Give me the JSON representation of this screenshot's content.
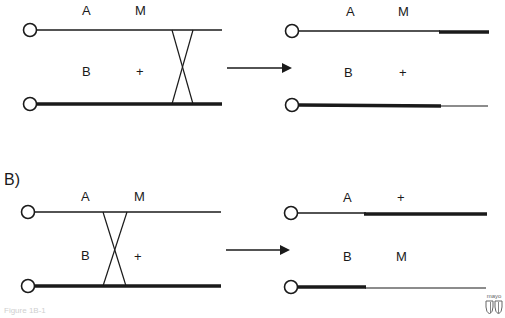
{
  "figure": {
    "panel_b_label": "B)",
    "caption": "Figure 1B-1",
    "logo_text": "mayo",
    "colors": {
      "line": "#1a1a1a",
      "background": "#ffffff"
    }
  },
  "panel_a": {
    "before": {
      "top_chromosome": {
        "labels": [
          "A",
          "M"
        ],
        "thickness": "thin"
      },
      "bottom_chromosome": {
        "labels": [
          "B",
          "+"
        ],
        "thickness": "thick"
      },
      "crossover": "between M and end (right of loci)"
    },
    "after": {
      "top_chromosome": {
        "labels": [
          "A",
          "M"
        ],
        "segments": [
          "thin",
          "thick"
        ]
      },
      "bottom_chromosome": {
        "labels": [
          "B",
          "+"
        ],
        "segments": [
          "thick",
          "thin"
        ]
      }
    }
  },
  "panel_b": {
    "before": {
      "top_chromosome": {
        "labels": [
          "A",
          "M"
        ],
        "thickness": "thin"
      },
      "bottom_chromosome": {
        "labels": [
          "B",
          "+"
        ],
        "thickness": "thick"
      },
      "crossover": "between A/B and M/+ loci"
    },
    "after": {
      "top_chromosome": {
        "labels": [
          "A",
          "+"
        ],
        "segments": [
          "thin",
          "thick"
        ]
      },
      "bottom_chromosome": {
        "labels": [
          "B",
          "M"
        ],
        "segments": [
          "thick",
          "thin"
        ]
      }
    }
  }
}
